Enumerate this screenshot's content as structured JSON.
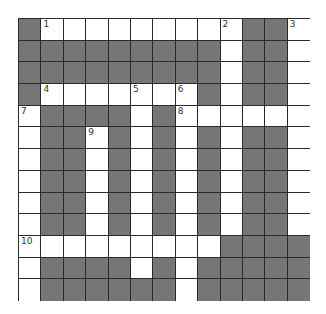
{
  "puzzle": {
    "rows": 13,
    "cols": 13,
    "colors": {
      "block": "#767676",
      "open": "#ffffff",
      "border": "#2a2a2a"
    },
    "layout": [
      "DWWWWWWWWWDDW",
      "DDDDDDDDDWDDW",
      "DDDDDDDDDWDDW",
      "DWWWWWWWDWDDW",
      "WDDDDWDWWWWWW",
      "WDDWDWDWDWDDW",
      "WDDWDWDWDWDDW",
      "WDDWDWDWDWDDW",
      "WDDWDWDWDWDDW",
      "WDDWDWDWDWDDW",
      "WWWWWWWWWDDDD",
      "WDDDDWDWDDDDD",
      "WDDDDDDWDDDDD"
    ],
    "numbers": [
      {
        "label": "1",
        "row": 0,
        "col": 1
      },
      {
        "label": "2",
        "row": 0,
        "col": 9
      },
      {
        "label": "3",
        "row": 0,
        "col": 12
      },
      {
        "label": "4",
        "row": 3,
        "col": 1
      },
      {
        "label": "5",
        "row": 3,
        "col": 5
      },
      {
        "label": "6",
        "row": 3,
        "col": 7
      },
      {
        "label": "7",
        "row": 4,
        "col": 0
      },
      {
        "label": "8",
        "row": 4,
        "col": 7
      },
      {
        "label": "9",
        "row": 5,
        "col": 3
      },
      {
        "label": "10",
        "row": 10,
        "col": 0
      }
    ]
  }
}
